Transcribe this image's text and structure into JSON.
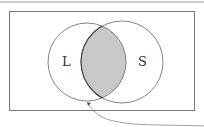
{
  "diagram": {
    "type": "venn",
    "sets": [
      {
        "label": "L",
        "cx": 87,
        "cy": 62,
        "r": 39
      },
      {
        "label": "S",
        "cx": 122,
        "cy": 62,
        "r": 41
      }
    ],
    "shaded_region": "intersection",
    "colors": {
      "stroke": "#555555",
      "shade": "#c8c8c8",
      "frame": "#777777"
    }
  }
}
